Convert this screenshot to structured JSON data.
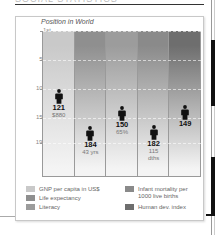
{
  "page": {
    "clipped_heading": "SOCIAL STATISTICS",
    "colors": {
      "panel_border": "#c8c8c8",
      "rule": "#333333",
      "marker": "#111111"
    }
  },
  "chart_data": {
    "type": "table",
    "title": "Position in World",
    "xlabel": "",
    "ylabel": "",
    "y_axis": {
      "ticks": [
        "1st",
        "50th",
        "100th",
        "150th",
        "193rd"
      ],
      "tick_values": [
        1,
        50,
        100,
        150,
        193
      ],
      "range": [
        1,
        193
      ],
      "inverted": true
    },
    "grid": true,
    "legend_position": "bottom",
    "categories": [
      "GNP per capita in US$",
      "Life expectancy",
      "Literacy",
      "Infant mortality per 1000 live births",
      "Human dev. index"
    ],
    "series": [
      {
        "name": "GNP per capita in US$",
        "rank": 121,
        "rank_label": "121",
        "value_label": "$880",
        "color": "#c9c9c9"
      },
      {
        "name": "Life expectancy",
        "rank": 184,
        "rank_label": "184",
        "value_label": "43 yrs",
        "color": "#8f8f8f"
      },
      {
        "name": "Literacy",
        "rank": 150,
        "rank_label": "150",
        "value_label": "65%",
        "color": "#9c9c9c"
      },
      {
        "name": "Infant mortality per 1000 live births",
        "rank": 182,
        "rank_label": "182",
        "value_label": "115 dths",
        "color": "#8a8a8a"
      },
      {
        "name": "Human dev. index",
        "rank": 149,
        "rank_label": "149",
        "value_label": "",
        "color": "#6e6e6e"
      }
    ]
  },
  "legend": {
    "items": [
      {
        "label": "GNP per capita in US$",
        "color": "#c9c9c9"
      },
      {
        "label": "Life expectancy",
        "color": "#8f8f8f"
      },
      {
        "label": "Literacy",
        "color": "#9c9c9c"
      },
      {
        "label": "Infant mortality per",
        "label2": "1000 live births",
        "color": "#8a8a8a"
      },
      {
        "label": "Human dev. index",
        "color": "#6e6e6e"
      }
    ]
  }
}
